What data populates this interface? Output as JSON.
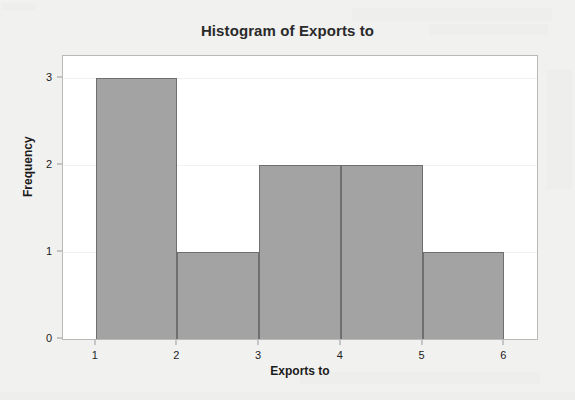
{
  "chart_data": {
    "type": "bar",
    "title": "Histogram of Exports to",
    "xlabel": "Exports to",
    "ylabel": "Frequency",
    "categories": [
      "1-2",
      "2-3",
      "3-4",
      "4-5",
      "5-6"
    ],
    "bin_edges": [
      1,
      2,
      3,
      4,
      5,
      6
    ],
    "values": [
      3,
      1,
      2,
      2,
      1
    ],
    "xlim": [
      0.6,
      6.4
    ],
    "ylim": [
      0,
      3.25
    ],
    "x_ticks": [
      "1",
      "2",
      "3",
      "4",
      "5",
      "6"
    ],
    "y_ticks": [
      "0",
      "1",
      "2",
      "3"
    ],
    "grid": true,
    "legend": null,
    "bar_fill_color": "#a3a3a3",
    "bar_edge_color": "#6f6f6f",
    "plot_background_color": "#ffffff",
    "page_background_color": "#f1f1f0"
  }
}
